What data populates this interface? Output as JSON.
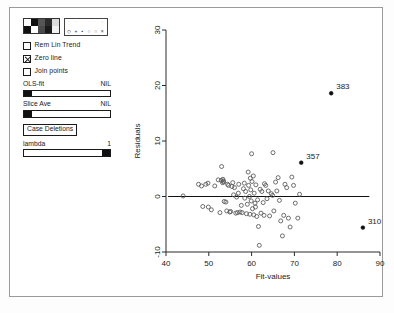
{
  "window": {
    "title": "Residual Plot"
  },
  "control_panel": {
    "color_palette": {
      "name": "color-palette",
      "swatches": [
        "#ffffff",
        "#111111",
        "#555555",
        "#2b2b2b",
        "#dcdcdc",
        "#111111",
        "#ffffff",
        "#4a4a4a",
        "#1a1a1a",
        "#f2f2f2"
      ]
    },
    "symbol_palette": {
      "name": "symbol-palette",
      "row_top": [
        "·",
        "·",
        "·",
        "·",
        "·",
        "○"
      ],
      "row_bottom": [
        "◇",
        "+",
        "▪",
        "○",
        "○",
        "×"
      ]
    },
    "checkboxes": [
      {
        "label": "Rem Lin Trend",
        "checked": false
      },
      {
        "label": "Zero line",
        "checked": true
      },
      {
        "label": "Join points",
        "checked": false
      }
    ],
    "sliders": [
      {
        "label": "OLS-fit",
        "value": "NIL",
        "thumb": "left"
      },
      {
        "label": "Slice Ave",
        "value": "NIL",
        "thumb": "left"
      },
      {
        "label": "lambda",
        "value": "1",
        "thumb": "right"
      }
    ],
    "buttons": [
      {
        "label": "Case Deletions"
      }
    ]
  },
  "chart_data": {
    "type": "scatter",
    "title": "",
    "xlabel": "Fit-values",
    "ylabel": "Residuals",
    "xlim": [
      40,
      90
    ],
    "ylim": [
      -10,
      30
    ],
    "xticks": [
      40,
      50,
      60,
      70,
      80,
      90
    ],
    "yticks": [
      -10,
      0,
      10,
      20,
      30
    ],
    "grid": false,
    "legend": "none",
    "annotations": [
      {
        "label": "383",
        "x": 78.6,
        "y": 18.6
      },
      {
        "label": "357",
        "x": 71.6,
        "y": 6.1
      },
      {
        "label": "310",
        "x": 86.0,
        "y": -5.6
      }
    ],
    "reference_lines": [
      {
        "name": "zero-line",
        "y": 0,
        "x_start": 40.5,
        "x_end": 87.5
      }
    ],
    "series": [
      {
        "name": "residuals",
        "marker": "open-circle",
        "points": [
          [
            44.0,
            0.1
          ],
          [
            47.6,
            2.2
          ],
          [
            48.3,
            1.9
          ],
          [
            48.6,
            -1.8
          ],
          [
            49.3,
            2.2
          ],
          [
            49.8,
            2.4
          ],
          [
            49.9,
            -1.9
          ],
          [
            50.6,
            -2.4
          ],
          [
            51.4,
            1.9
          ],
          [
            52.2,
            3.0
          ],
          [
            52.6,
            -2.9
          ],
          [
            53.0,
            5.4
          ],
          [
            53.2,
            2.5
          ],
          [
            53.3,
            3.1
          ],
          [
            53.4,
            2.8
          ],
          [
            53.5,
            2.6
          ],
          [
            53.6,
            -0.9
          ],
          [
            54.2,
            -2.6
          ],
          [
            54.4,
            2.2
          ],
          [
            54.6,
            2.0
          ],
          [
            54.9,
            -2.8
          ],
          [
            55.1,
            -2.7
          ],
          [
            55.4,
            1.8
          ],
          [
            55.6,
            2.5
          ],
          [
            55.8,
            0.3
          ],
          [
            56.0,
            1.6
          ],
          [
            56.3,
            -3.0
          ],
          [
            56.5,
            -0.1
          ],
          [
            56.7,
            -2.9
          ],
          [
            57.0,
            2.2
          ],
          [
            57.3,
            -2.8
          ],
          [
            57.6,
            -1.6
          ],
          [
            57.8,
            -2.9
          ],
          [
            58.1,
            1.4
          ],
          [
            58.4,
            -0.3
          ],
          [
            58.6,
            0.9
          ],
          [
            58.8,
            -3.1
          ],
          [
            59.0,
            -1.4
          ],
          [
            59.2,
            4.4
          ],
          [
            59.3,
            2.0
          ],
          [
            59.5,
            0.0
          ],
          [
            59.6,
            -3.2
          ],
          [
            59.7,
            3.3
          ],
          [
            59.8,
            1.2
          ],
          [
            59.9,
            -0.8
          ],
          [
            60.0,
            7.7
          ],
          [
            60.1,
            2.7
          ],
          [
            60.2,
            -2.2
          ],
          [
            60.4,
            3.7
          ],
          [
            60.5,
            -3.3
          ],
          [
            60.6,
            0.6
          ],
          [
            60.8,
            -1.2
          ],
          [
            61.0,
            2.1
          ],
          [
            61.2,
            -3.6
          ],
          [
            61.4,
            -0.6
          ],
          [
            61.6,
            -5.4
          ],
          [
            61.8,
            -8.8
          ],
          [
            62.0,
            1.3
          ],
          [
            62.2,
            -3.0
          ],
          [
            62.4,
            0.9
          ],
          [
            62.7,
            -1.1
          ],
          [
            63.0,
            2.3
          ],
          [
            63.3,
            2.0
          ],
          [
            63.6,
            -0.4
          ],
          [
            63.9,
            1.0
          ],
          [
            64.2,
            -3.5
          ],
          [
            64.6,
            0.5
          ],
          [
            65.0,
            7.9
          ],
          [
            65.2,
            -2.6
          ],
          [
            65.6,
            2.6
          ],
          [
            65.9,
            1.0
          ],
          [
            66.2,
            3.4
          ],
          [
            66.5,
            -0.7
          ],
          [
            66.8,
            -4.4
          ],
          [
            67.2,
            -7.1
          ],
          [
            67.5,
            -3.4
          ],
          [
            67.8,
            2.2
          ],
          [
            68.2,
            1.6
          ],
          [
            68.6,
            -3.9
          ],
          [
            69.0,
            -5.5
          ],
          [
            69.4,
            3.5
          ],
          [
            69.8,
            2.0
          ],
          [
            70.2,
            -1.2
          ],
          [
            70.8,
            -3.9
          ],
          [
            71.2,
            0.4
          ],
          [
            52.9,
            2.9
          ],
          [
            58.3,
            2.4
          ],
          [
            60.9,
            -1.9
          ],
          [
            62.9,
            -3.4
          ],
          [
            64.9,
            0.2
          ],
          [
            56.9,
            0.6
          ],
          [
            54.0,
            -1.0
          ]
        ]
      },
      {
        "name": "highlighted-cases",
        "marker": "filled-circle",
        "points": [
          [
            78.6,
            18.6
          ],
          [
            71.6,
            6.1
          ],
          [
            86.0,
            -5.6
          ]
        ]
      }
    ]
  }
}
